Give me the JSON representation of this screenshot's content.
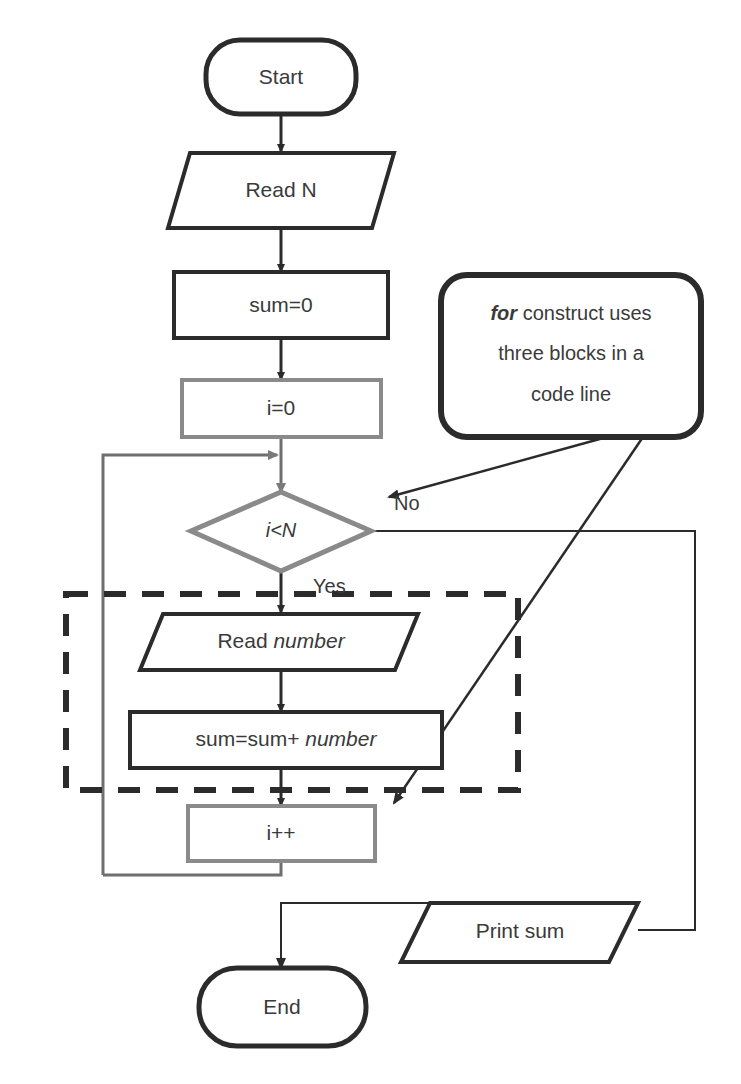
{
  "diagram": {
    "colors": {
      "dark_stroke": "#2b2b2b",
      "gray_stroke": "#808080",
      "text": "#3a3a3a",
      "background": "#ffffff"
    },
    "nodes": {
      "start": {
        "label": "Start",
        "shape": "terminator",
        "stroke": "dark"
      },
      "read_n": {
        "label": "Read N",
        "shape": "parallelogram",
        "stroke": "dark"
      },
      "sum_init": {
        "label": "sum=0",
        "shape": "process",
        "stroke": "dark"
      },
      "i_init": {
        "label": "i=0",
        "shape": "process",
        "stroke": "gray"
      },
      "condition": {
        "label": "i<N",
        "shape": "decision",
        "stroke": "gray",
        "italic": true
      },
      "read_number": {
        "label_plain": "Read ",
        "label_italic": "number",
        "shape": "parallelogram",
        "stroke": "dark"
      },
      "accumulate": {
        "label_plain": "sum=sum+ ",
        "label_italic": "number",
        "shape": "process",
        "stroke": "dark"
      },
      "increment": {
        "label": "i++",
        "shape": "process",
        "stroke": "gray"
      },
      "print_sum": {
        "label": "Print sum",
        "shape": "parallelogram",
        "stroke": "dark"
      },
      "end": {
        "label": "End",
        "shape": "terminator",
        "stroke": "dark"
      }
    },
    "edge_labels": {
      "no": "No",
      "yes": "Yes"
    },
    "callout": {
      "shape": "rounded-rectangle",
      "stroke": "dark",
      "line1_emphasis": "for",
      "line1_rest": " construct uses",
      "line2": "three blocks in a",
      "line3": "code line"
    },
    "annotation_region": {
      "style": "dashed",
      "stroke": "dark",
      "description": "dashed grouping box around Read number and sum=sum+ number"
    }
  }
}
